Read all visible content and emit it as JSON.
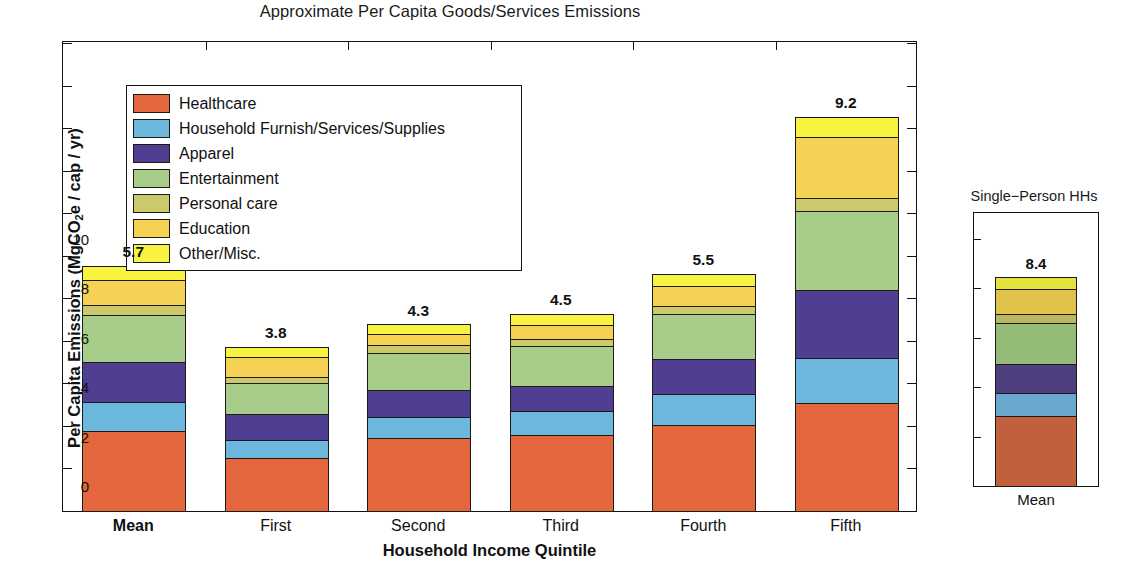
{
  "main": {
    "title": "Approximate Per Capita Goods/Services Emissions",
    "y_axis_label_pre": "Per Capita Emissions (MgCO",
    "y_axis_label_sub": "2",
    "y_axis_label_post": "e / cap / yr)",
    "x_axis_label": "Household Income Quintile"
  },
  "legend": {
    "items": [
      {
        "label": "Healthcare",
        "color": "#E3663C"
      },
      {
        "label": "Household Furnish/Services/Supplies",
        "color": "#6CB7DE"
      },
      {
        "label": "Apparel",
        "color": "#503E92"
      },
      {
        "label": "Entertainment",
        "color": "#A8CC89"
      },
      {
        "label": "Personal care",
        "color": "#CBC96B"
      },
      {
        "label": "Education",
        "color": "#F6D254"
      },
      {
        "label": "Other/Misc.",
        "color": "#F7F340"
      }
    ]
  },
  "inset": {
    "title": "Single−Person HHs",
    "y_axis_label": "Per Capita or HH",
    "x_tick": "Mean"
  },
  "chart_data": [
    {
      "type": "bar",
      "subtype": "stacked",
      "title": "Approximate Per Capita Goods/Services Emissions",
      "xlabel": "Household Income Quintile",
      "ylabel": "Per Capita Emissions (MgCO2e / cap / yr)",
      "ylim": [
        0,
        11
      ],
      "yticks": [
        0,
        1,
        2,
        3,
        4,
        5,
        6,
        7,
        8,
        9,
        10,
        11
      ],
      "grid": false,
      "legend_position": "upper-left-inside",
      "categories": [
        "Mean",
        "First",
        "Second",
        "Third",
        "Fourth",
        "Fifth"
      ],
      "category_emphasis": [
        "bold",
        "normal",
        "normal",
        "normal",
        "normal",
        "normal"
      ],
      "bar_labels": [
        "5.7",
        "3.8",
        "4.3",
        "4.5",
        "5.5",
        "9.2"
      ],
      "totals": [
        5.75,
        3.85,
        4.38,
        4.62,
        5.57,
        9.25
      ],
      "series": [
        {
          "name": "Healthcare",
          "color": "#E3663C",
          "values": [
            1.87,
            1.25,
            1.72,
            1.78,
            2.03,
            2.55
          ]
        },
        {
          "name": "Household Furnish/Services/Supplies",
          "color": "#6CB7DE",
          "values": [
            0.7,
            0.43,
            0.48,
            0.57,
            0.72,
            1.05
          ]
        },
        {
          "name": "Apparel",
          "color": "#503E92",
          "values": [
            0.93,
            0.6,
            0.65,
            0.6,
            0.82,
            1.6
          ]
        },
        {
          "name": "Entertainment",
          "color": "#A8CC89",
          "values": [
            1.1,
            0.72,
            0.87,
            0.93,
            1.05,
            1.85
          ]
        },
        {
          "name": "Personal care",
          "color": "#CBC96B",
          "values": [
            0.25,
            0.15,
            0.18,
            0.17,
            0.2,
            0.3
          ]
        },
        {
          "name": "Education",
          "color": "#F6D254",
          "values": [
            0.57,
            0.47,
            0.25,
            0.33,
            0.46,
            1.45
          ]
        },
        {
          "name": "Other/Misc.",
          "color": "#F7F340",
          "values": [
            0.33,
            0.23,
            0.23,
            0.24,
            0.29,
            0.45
          ]
        }
      ]
    },
    {
      "type": "bar",
      "subtype": "stacked",
      "title": "Single−Person HHs",
      "xlabel": "",
      "ylabel": "Per Capita or HH",
      "ylim": [
        0,
        11
      ],
      "yticks": [
        0,
        2,
        4,
        6,
        8,
        10
      ],
      "grid": false,
      "categories": [
        "Mean"
      ],
      "bar_labels": [
        "8.4"
      ],
      "totals": [
        8.45
      ],
      "series": [
        {
          "name": "Healthcare",
          "color": "#C0603C",
          "values": [
            2.85
          ]
        },
        {
          "name": "Household Furnish/Services/Supplies",
          "color": "#6CA8CE",
          "values": [
            0.93
          ]
        },
        {
          "name": "Apparel",
          "color": "#4D3F80",
          "values": [
            1.14
          ]
        },
        {
          "name": "Entertainment",
          "color": "#95BB79",
          "values": [
            1.68
          ]
        },
        {
          "name": "Personal care",
          "color": "#B9B860",
          "values": [
            0.35
          ]
        },
        {
          "name": "Education",
          "color": "#E0C24A",
          "values": [
            1.0
          ]
        },
        {
          "name": "Other/Misc.",
          "color": "#E2E33C",
          "values": [
            0.5
          ]
        }
      ]
    }
  ]
}
